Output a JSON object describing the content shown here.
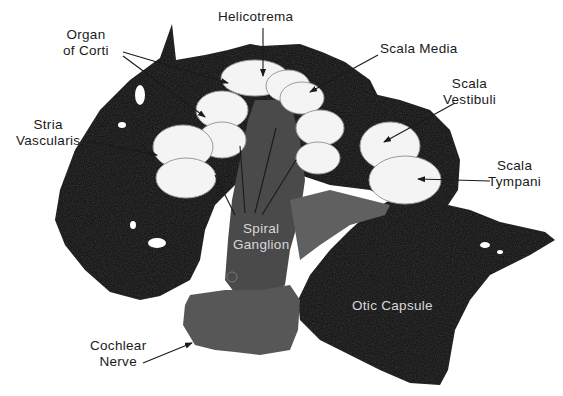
{
  "figure": {
    "colors": {
      "background": "#ffffff",
      "bone": "#0b0b0b",
      "tissue": "#4a4a4a",
      "nerve": "#5a5a5a",
      "cavity": "#f4f4f4",
      "label_dark": "#1a1a1a",
      "label_light": "#d8d8d8"
    }
  },
  "labels": {
    "helicotrema": {
      "text": "Helicotrema"
    },
    "organ_of_corti": {
      "line1": "Organ",
      "line2": "of Corti"
    },
    "scala_media": {
      "text": "Scala Media"
    },
    "scala_vestibuli": {
      "line1": "Scala",
      "line2": "Vestibuli"
    },
    "stria_vascularis": {
      "line1": "Stria",
      "line2": "Vascularis"
    },
    "scala_tympani": {
      "line1": "Scala",
      "line2": "Tympani"
    },
    "spiral_ganglion": {
      "line1": "Spiral",
      "line2": "Ganglion"
    },
    "otic_capsule": {
      "text": "Otic Capsule"
    },
    "cochlear_nerve": {
      "line1": "Cochlear",
      "line2": "Nerve"
    }
  }
}
